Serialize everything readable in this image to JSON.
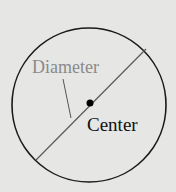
{
  "diagram": {
    "labels": {
      "diameter": "Diameter",
      "center": "Center"
    },
    "colors": {
      "background": "#e6e6e4",
      "circle": "#1a1a1a",
      "diameter_line": "#5a5a5a",
      "diameter_label": "#8a8a8a",
      "center_label": "#111111"
    }
  }
}
